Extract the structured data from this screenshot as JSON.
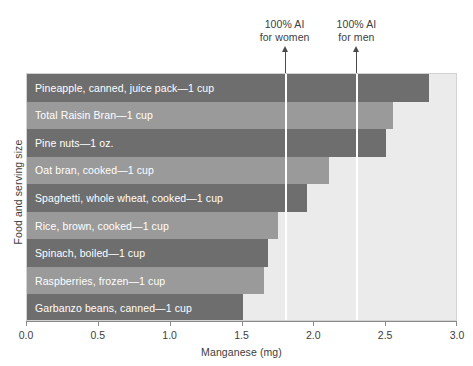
{
  "chart_data": {
    "type": "bar",
    "orientation": "horizontal",
    "title": "",
    "xlabel": "Manganese (mg)",
    "ylabel": "Food and serving size",
    "xlim": [
      0.0,
      3.0
    ],
    "xticks": [
      "0.0",
      "0.5",
      "1.0",
      "1.5",
      "2.0",
      "2.5",
      "3.0"
    ],
    "xtick_values": [
      0.0,
      0.5,
      1.0,
      1.5,
      2.0,
      2.5,
      3.0
    ],
    "grid": false,
    "legend": "none",
    "categories": [
      "Pineapple, canned, juice pack—1 cup",
      "Total Raisin Bran—1 cup",
      "Pine nuts—1 oz.",
      "Oat bran, cooked—1 cup",
      "Spaghetti, whole wheat, cooked—1 cup",
      "Rice, brown, cooked—1 cup",
      "Spinach, boiled—1 cup",
      "Raspberries, frozen—1 cup",
      "Garbanzo beans, canned—1 cup"
    ],
    "values": [
      2.8,
      2.55,
      2.5,
      2.1,
      1.95,
      1.75,
      1.68,
      1.65,
      1.5
    ],
    "bar_shades": [
      "dark",
      "light",
      "dark",
      "light",
      "dark",
      "light",
      "dark",
      "light",
      "dark"
    ],
    "annotations": [
      {
        "label_line1": "100% AI",
        "label_line2": "for women",
        "value": 1.8
      },
      {
        "label_line1": "100% AI",
        "label_line2": "for men",
        "value": 2.3
      }
    ],
    "colors": {
      "bar_dark": "#6e6e6e",
      "bar_light": "#9a9a9a",
      "plot_background": "#ebebeb",
      "reference_line": "#ffffff",
      "label_text": "#ffffff",
      "axis_text": "#3d3d3d"
    }
  }
}
